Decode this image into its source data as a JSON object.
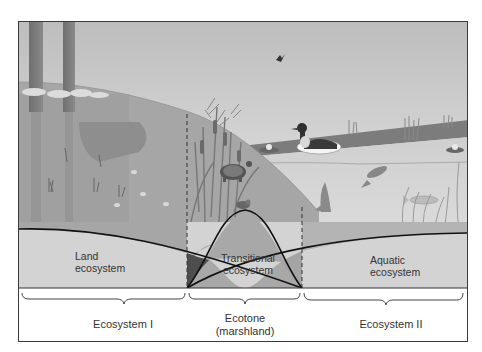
{
  "figure": {
    "type": "ecotone diagram",
    "colors": {
      "sky_top": "#bdbdbd",
      "sky_bottom": "#ececec",
      "land": "#a9a9a9",
      "water_surface": "#c4c4c4",
      "water_deep": "#d6d6d6",
      "band_fill": "#d2d2d2",
      "overlap_fill": "#a0a0a0",
      "dark_overlap": "#4c4c4c",
      "curve": "#111111"
    }
  },
  "zones": {
    "land": {
      "label_line1": "Land",
      "label_line2": "ecosystem"
    },
    "transitional": {
      "label_line1": "Transitional",
      "label_line2": "ecosystem"
    },
    "aquatic": {
      "label_line1": "Aquatic",
      "label_line2": "ecosystem"
    }
  },
  "bottom_labels": {
    "left": "Ecosystem I",
    "middle_line1": "Ecotone",
    "middle_line2": "(marshland)",
    "right": "Ecosystem II"
  },
  "illustration": {
    "elements": [
      "trees",
      "cattails",
      "turtle",
      "frog",
      "duck",
      "bird",
      "fish",
      "water-lilies",
      "aquatic-plants"
    ]
  }
}
